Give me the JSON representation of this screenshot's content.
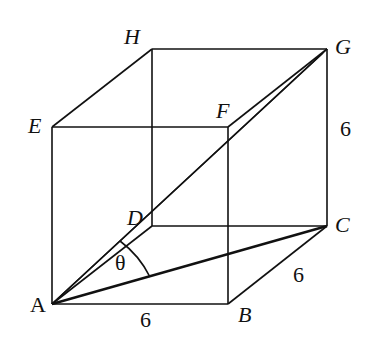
{
  "diagram": {
    "type": "cube",
    "vertices": {
      "A": {
        "label": "A",
        "x": 52,
        "y": 304
      },
      "B": {
        "label": "B",
        "x": 228,
        "y": 304
      },
      "C": {
        "label": "C",
        "x": 327,
        "y": 226
      },
      "D": {
        "label": "D",
        "x": 152,
        "y": 226
      },
      "E": {
        "label": "E",
        "x": 52,
        "y": 127
      },
      "F": {
        "label": "F",
        "x": 228,
        "y": 127
      },
      "G": {
        "label": "G",
        "x": 327,
        "y": 49
      },
      "H": {
        "label": "H",
        "x": 152,
        "y": 49
      }
    },
    "labels": {
      "A": "A",
      "B": "B",
      "C": "C",
      "D": "D",
      "E": "E",
      "F": "F",
      "G": "G",
      "H": "H",
      "angle": "θ",
      "len_ab": "6",
      "len_bc": "6",
      "len_cg": "6"
    },
    "edges": [
      "AB",
      "BC",
      "CD",
      "DA",
      "EF",
      "FG",
      "GH",
      "HE",
      "AE",
      "BF",
      "CG",
      "DH"
    ],
    "diagonals": [
      "AG",
      "AC",
      "AD-G"
    ],
    "angle_mark": {
      "at": "A",
      "between": [
        "AC",
        "AG"
      ],
      "name": "θ"
    }
  }
}
